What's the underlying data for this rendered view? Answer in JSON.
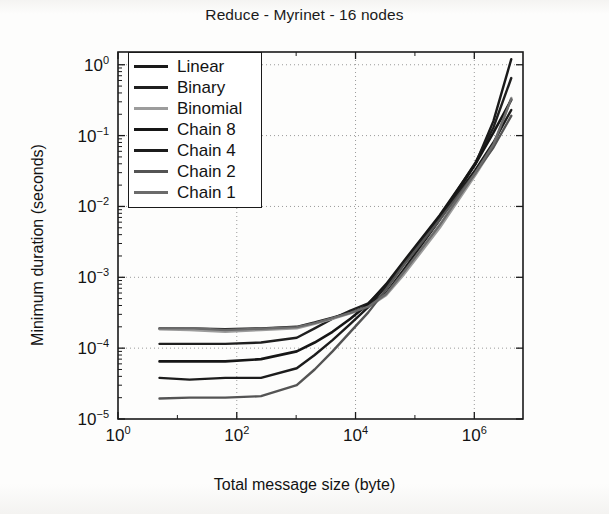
{
  "figure": {
    "title": "Reduce - Myrinet - 16 nodes",
    "width": 609,
    "height": 514,
    "background": "#fdfdfc"
  },
  "axes": {
    "plot_box": {
      "left": 118,
      "top": 52,
      "right": 523,
      "bottom": 419
    },
    "x": {
      "label": "Total message size (byte)",
      "scale": "log10",
      "min_exp": 0,
      "max_exp": 6.82,
      "ticks": [
        {
          "exp": 0,
          "base": "10",
          "sup": "0"
        },
        {
          "exp": 2,
          "base": "10",
          "sup": "2"
        },
        {
          "exp": 4,
          "base": "10",
          "sup": "4"
        },
        {
          "exp": 6,
          "base": "10",
          "sup": "6"
        }
      ]
    },
    "y": {
      "label": "Minimum duration (seconds)",
      "scale": "log10",
      "min_exp": -5,
      "max_exp": 0.18,
      "ticks": [
        {
          "exp": 0,
          "base": "10",
          "sup": "0"
        },
        {
          "exp": -1,
          "base": "10",
          "sup": "-1"
        },
        {
          "exp": -2,
          "base": "10",
          "sup": "-2"
        },
        {
          "exp": -3,
          "base": "10",
          "sup": "-3"
        },
        {
          "exp": -4,
          "base": "10",
          "sup": "-4"
        },
        {
          "exp": -5,
          "base": "10",
          "sup": "-5"
        }
      ]
    },
    "grid": {
      "enabled": true,
      "style": "dotted",
      "color": "#9a9a9a"
    },
    "frame_color": "#1a1a1a"
  },
  "legend": {
    "position": "top-left-inside",
    "border_color": "#1a1a1a",
    "background": "#ffffff",
    "entries": [
      {
        "label": "Linear",
        "color": "#1a1a1a",
        "width": 2.4
      },
      {
        "label": "Binary",
        "color": "#1f1f1f",
        "width": 2.4
      },
      {
        "label": "Binomial",
        "color": "#9c9c9c",
        "width": 2.4
      },
      {
        "label": "Chain 8",
        "color": "#161616",
        "width": 2.6
      },
      {
        "label": "Chain 4",
        "color": "#1c1c1c",
        "width": 2.4
      },
      {
        "label": "Chain 2",
        "color": "#545454",
        "width": 2.4
      },
      {
        "label": "Chain 1",
        "color": "#6b6b6b",
        "width": 2.4
      }
    ]
  },
  "chart_data": {
    "type": "line",
    "title": "Reduce - Myrinet - 16 nodes",
    "xlabel": "Total message size (byte)",
    "ylabel": "Minimum duration (seconds)",
    "xscale": "log",
    "yscale": "log",
    "xlim": [
      1,
      6600000
    ],
    "ylim": [
      1e-05,
      1.5
    ],
    "grid": true,
    "legend_position": "upper left",
    "x": [
      5,
      16,
      64,
      256,
      1024,
      2048,
      4096,
      8192,
      16384,
      32768,
      65536,
      262144,
      1048576,
      2097152,
      4194304
    ],
    "series": [
      {
        "name": "Linear",
        "color": "#1a1a1a",
        "values": [
          0.00019,
          0.00019,
          0.000185,
          0.00019,
          0.0002,
          0.00023,
          0.00027,
          0.00032,
          0.00039,
          0.0006,
          0.0013,
          0.0065,
          0.04,
          0.16,
          1.2
        ]
      },
      {
        "name": "Binary",
        "color": "#1f1f1f",
        "values": [
          0.000115,
          0.000115,
          0.000115,
          0.00012,
          0.00014,
          0.00019,
          0.00026,
          0.00034,
          0.00043,
          0.00075,
          0.0016,
          0.007,
          0.042,
          0.13,
          0.65
        ]
      },
      {
        "name": "Binomial",
        "color": "#9c9c9c",
        "values": [
          0.000185,
          0.00018,
          0.00017,
          0.00018,
          0.00019,
          0.00022,
          0.00026,
          0.00031,
          0.00038,
          0.00056,
          0.0011,
          0.005,
          0.028,
          0.07,
          0.34
        ]
      },
      {
        "name": "Chain 8",
        "color": "#161616",
        "values": [
          6.5e-05,
          6.5e-05,
          6.5e-05,
          7e-05,
          9e-05,
          0.00012,
          0.00017,
          0.00026,
          0.00042,
          0.0008,
          0.0017,
          0.0075,
          0.04,
          0.11,
          0.32
        ]
      },
      {
        "name": "Chain 4",
        "color": "#1c1c1c",
        "values": [
          3.8e-05,
          3.6e-05,
          3.8e-05,
          3.8e-05,
          5.2e-05,
          8e-05,
          0.00013,
          0.00022,
          0.00038,
          0.00075,
          0.0016,
          0.007,
          0.033,
          0.08,
          0.23
        ]
      },
      {
        "name": "Chain 2",
        "color": "#545454",
        "values": [
          1.95e-05,
          2e-05,
          2e-05,
          2.1e-05,
          3e-05,
          5e-05,
          9e-05,
          0.00017,
          0.00032,
          0.00068,
          0.0015,
          0.0065,
          0.03,
          0.068,
          0.19
        ]
      },
      {
        "name": "Chain 1",
        "color": "#6b6b6b",
        "values": [
          0.00019,
          0.000192,
          0.00018,
          0.000188,
          0.000198,
          0.000225,
          0.000265,
          0.000315,
          0.000385,
          0.00058,
          0.0012,
          0.0055,
          0.03,
          0.075,
          0.33
        ]
      }
    ]
  }
}
